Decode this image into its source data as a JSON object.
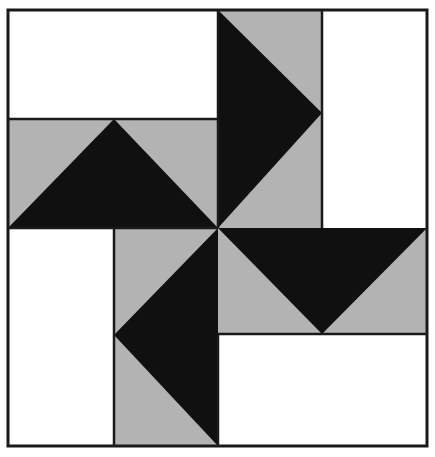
{
  "figure": {
    "kind": "quilt-block-diagram",
    "canvas": {
      "width": 435,
      "height": 457
    },
    "colors": {
      "background": "#ffffff",
      "white": "#ffffff",
      "gray": "#b3b3b3",
      "black": "#101010",
      "outline": "#1a1a1a"
    },
    "grid": {
      "x": [
        8,
        114,
        218,
        322,
        427
      ],
      "y": [
        10,
        119,
        228,
        334,
        446
      ],
      "columns": 4,
      "rows": 4,
      "line_width": 2.5
    },
    "outer_border": {
      "x": 8,
      "y": 10,
      "width": 419,
      "height": 436,
      "stroke": "#1a1a1a",
      "stroke_width": 3
    },
    "patches": [
      {
        "name": "top-left-white-rect",
        "shape": "rect",
        "fill": "white",
        "points": "8,10 218,10 218,119 8,119"
      },
      {
        "name": "top-center-gray-square",
        "shape": "rect",
        "fill": "gray",
        "points": "218,10 322,10 322,228 218,228"
      },
      {
        "name": "top-center-black-triangle",
        "shape": "triangle",
        "fill": "black",
        "points": "218,10 322,113 218,228"
      },
      {
        "name": "top-right-white-rect",
        "shape": "rect",
        "fill": "white",
        "points": "322,10 427,10 427,228 322,228"
      },
      {
        "name": "left-gray-band",
        "shape": "rect",
        "fill": "gray",
        "points": "8,119 218,119 218,228 8,228"
      },
      {
        "name": "left-black-triangle",
        "shape": "triangle",
        "fill": "black",
        "points": "8,228 114,119 218,228"
      },
      {
        "name": "bottom-left-white-rect",
        "shape": "rect",
        "fill": "white",
        "points": "8,228 114,228 114,446 8,446"
      },
      {
        "name": "bottom-center-gray-band",
        "shape": "rect",
        "fill": "gray",
        "points": "114,228 218,228 218,446 114,446"
      },
      {
        "name": "bottom-center-black-triangle",
        "shape": "triangle",
        "fill": "black",
        "points": "218,228 114,335 218,446"
      },
      {
        "name": "right-gray-band",
        "shape": "rect",
        "fill": "gray",
        "points": "218,228 427,228 427,334 218,334"
      },
      {
        "name": "right-black-triangle",
        "shape": "triangle",
        "fill": "black",
        "points": "218,228 427,228 322,334"
      },
      {
        "name": "bottom-right-white-rect",
        "shape": "rect",
        "fill": "white",
        "points": "218,334 427,334 427,446 218,446"
      }
    ],
    "divider_lines": [
      {
        "name": "divider-h-upper-left",
        "x1": 8,
        "y1": 119,
        "x2": 218,
        "y2": 119
      },
      {
        "name": "divider-h-center",
        "x1": 8,
        "y1": 228,
        "x2": 218,
        "y2": 228
      },
      {
        "name": "divider-h-lower-right",
        "x1": 218,
        "y1": 334,
        "x2": 427,
        "y2": 334
      },
      {
        "name": "divider-v-left",
        "x1": 114,
        "y1": 228,
        "x2": 114,
        "y2": 446
      },
      {
        "name": "divider-v-center-top",
        "x1": 218,
        "y1": 10,
        "x2": 218,
        "y2": 228
      },
      {
        "name": "divider-v-right-top",
        "x1": 322,
        "y1": 10,
        "x2": 322,
        "y2": 228
      },
      {
        "name": "divider-v-center-bot",
        "x1": 218,
        "y1": 334,
        "x2": 218,
        "y2": 446
      }
    ],
    "center_point": {
      "x": 218,
      "y": 228
    }
  }
}
